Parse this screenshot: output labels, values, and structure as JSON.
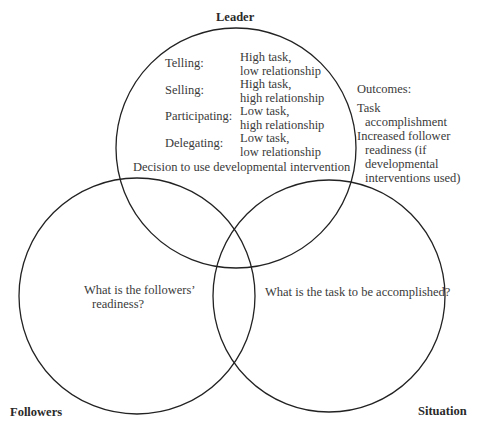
{
  "circles": {
    "leader": {
      "label": "Leader",
      "cx": 236,
      "cy": 148,
      "r": 120
    },
    "followers": {
      "label": "Followers",
      "cx": 137,
      "cy": 296,
      "r": 118
    },
    "situation": {
      "label": "Situation",
      "cx": 329,
      "cy": 296,
      "r": 116
    }
  },
  "stroke_color": "#222222",
  "leader_styles": [
    {
      "style": "Telling:",
      "line1": "High task,",
      "line2": "low relationship"
    },
    {
      "style": "Selling:",
      "line1": "High task,",
      "line2": "high relationship"
    },
    {
      "style": "Participating:",
      "line1": "Low task,",
      "line2": "high relationship"
    },
    {
      "style": "Delegating:",
      "line1": "Low task,",
      "line2": "low relationship"
    }
  ],
  "decision_text": "Decision to use developmental intervention",
  "outcomes": {
    "title": "Outcomes:",
    "item1_line1": "Task",
    "item1_line2": "accomplishment",
    "item2_line1": "Increased follower",
    "item2_line2": "readiness (if",
    "item2_line3": "developmental",
    "item2_line4": "interventions used)"
  },
  "followers_question": {
    "line1": "What is the followers’",
    "line2": "readiness?"
  },
  "situation_question": "What is the task to be accomplished?"
}
